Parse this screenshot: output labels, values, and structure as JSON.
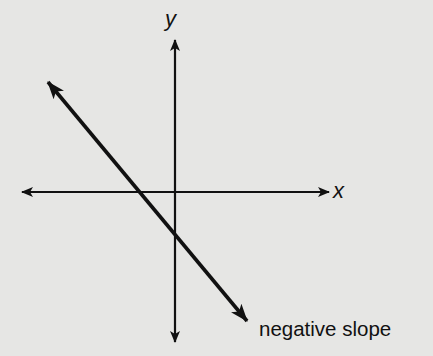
{
  "diagram": {
    "title": "",
    "axes": {
      "x_label": "x",
      "y_label": "y"
    },
    "line": {
      "description": "line with negative slope crossing both axes",
      "caption": "negative slope"
    },
    "colors": {
      "background": "#e6e6e4",
      "ink": "#111111"
    }
  }
}
